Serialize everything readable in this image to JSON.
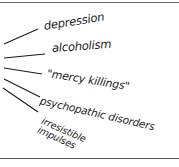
{
  "diagram": {
    "type": "fan-out list",
    "style": "handwritten",
    "colors": {
      "ink": "#1a1a1a",
      "rule": "#6a6a6a",
      "background": "#ffffff"
    },
    "labels": [
      {
        "id": "depression",
        "text": "depression"
      },
      {
        "id": "alcoholism",
        "text": "alcoholism"
      },
      {
        "id": "mercy-killings",
        "text": "\"mercy killings\""
      },
      {
        "id": "psychopathic-disorders",
        "text": "psychopathic disorders"
      },
      {
        "id": "irresistible-impulses",
        "text": "irresistible\nimpulses"
      }
    ]
  }
}
